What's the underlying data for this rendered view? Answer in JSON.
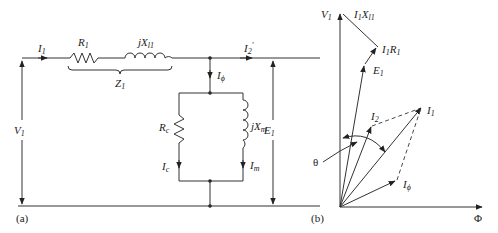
{
  "figure": {
    "panel_a": {
      "caption": "(a)",
      "title": "Equivalent circuit of transformer (primary side)",
      "labels": {
        "input_current": "I",
        "input_current_sub": "1",
        "primary_resistance": "R",
        "primary_resistance_sub": "1",
        "leakage_reactance": "jX",
        "leakage_reactance_sub": "l1",
        "primary_impedance": "Z",
        "primary_impedance_sub": "1",
        "referred_load_current": "I",
        "referred_load_current_sub": "2",
        "referred_load_current_prime": "′",
        "excitation_current": "I",
        "excitation_current_sub": "ϕ",
        "core_loss_resistance": "R",
        "core_loss_resistance_sub": "c",
        "magnetizing_reactance": "jX",
        "magnetizing_reactance_sub": "m",
        "core_loss_current": "I",
        "core_loss_current_sub": "c",
        "magnetizing_current": "I",
        "magnetizing_current_sub": "m",
        "applied_voltage": "V",
        "applied_voltage_sub": "1",
        "induced_emf": "E",
        "induced_emf_sub": "1"
      }
    },
    "panel_b": {
      "caption": "(b)",
      "title": "Phasor diagram",
      "labels": {
        "applied_voltage": "V",
        "applied_voltage_sub": "1",
        "reactance_drop": "I",
        "reactance_drop_mid": "1",
        "reactance_drop_x": "X",
        "reactance_drop_sub": "l1",
        "resistance_drop": "I",
        "resistance_drop_mid": "1",
        "resistance_drop_r": "R",
        "resistance_drop_sub": "1",
        "induced_emf": "E",
        "induced_emf_sub": "1",
        "load_current": "I",
        "load_current_sub": "2",
        "primary_current": "I",
        "primary_current_sub": "1",
        "excitation_current": "I",
        "excitation_current_sub": "ϕ",
        "angle": "θ",
        "flux_axis": "Φ"
      }
    }
  }
}
